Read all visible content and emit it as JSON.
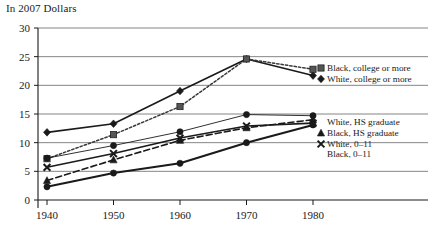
{
  "chart_data": {
    "type": "line",
    "title": "In 2007 Dollars",
    "subtitle": "",
    "xlabel": "",
    "ylabel": "",
    "x": [
      1940,
      1950,
      1960,
      1970,
      1980
    ],
    "xtick_labels": [
      "1940",
      "1950",
      "1960",
      "1970",
      "1980"
    ],
    "ytick_labels": [
      "0",
      "5",
      "10",
      "15",
      "20",
      "25",
      "30"
    ],
    "ytick_values": [
      0,
      5,
      10,
      15,
      20,
      25,
      30
    ],
    "xlim": [
      1935,
      1985
    ],
    "ylim": [
      0,
      30
    ],
    "grid": "horizontal",
    "legend_position": "right",
    "series": [
      {
        "name": "White, college or more",
        "values": [
          11.8,
          13.3,
          19.0,
          24.6,
          21.7
        ],
        "line_style": "solid",
        "marker": "diamond",
        "color": "#1a1a1a"
      },
      {
        "name": "Black, college or more",
        "values": [
          7.2,
          11.4,
          16.3,
          24.6,
          22.8
        ],
        "line_style": "dotted",
        "marker": "square",
        "color": "#3a3a3a"
      },
      {
        "name": "White, HS graduate",
        "values": [
          7.3,
          9.5,
          11.9,
          14.9,
          14.7
        ],
        "line_style": "thin-solid",
        "marker": "circle",
        "color": "#1a1a1a"
      },
      {
        "name": "Black, HS graduate",
        "values": [
          3.4,
          7.0,
          10.4,
          12.6,
          14.0
        ],
        "line_style": "dashed",
        "marker": "triangle",
        "color": "#1a1a1a"
      },
      {
        "name": "White, 0–11",
        "values": [
          5.7,
          8.1,
          10.8,
          12.9,
          13.4
        ],
        "line_style": "solid",
        "marker": "x",
        "color": "#1a1a1a"
      },
      {
        "name": "Black, 0–11",
        "values": [
          2.3,
          4.7,
          6.4,
          10.0,
          13.1
        ],
        "line_style": "solid-thick",
        "marker": "circle",
        "color": "#1a1a1a"
      }
    ],
    "legend_entries": [
      {
        "label": "Black, college or more",
        "series": "Black, college or more"
      },
      {
        "label": "White, college or more",
        "series": "White, college or more"
      },
      {
        "label": "White, HS graduate",
        "series": "White, HS graduate"
      },
      {
        "label": "Black, HS graduate",
        "series": "Black, HS graduate"
      },
      {
        "label": "White, 0–11",
        "series": "White, 0–11"
      },
      {
        "label": "Black, 0–11",
        "series": "Black, 0–11"
      }
    ],
    "colors": {
      "ink": "#1a1a1a",
      "grid": "#777777",
      "axis": "#1a1a1a",
      "background": "#ffffff"
    }
  }
}
